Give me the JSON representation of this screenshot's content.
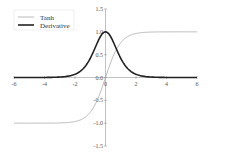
{
  "chart_data": {
    "type": "line",
    "title": "",
    "xlabel": "",
    "ylabel": "",
    "xlim": [
      -6,
      6
    ],
    "ylim": [
      -1.5,
      1.5
    ],
    "x_ticks": [
      -6,
      -4,
      -2,
      0,
      2,
      4,
      6
    ],
    "x_tick_labels": [
      "-6",
      "-4",
      "-2",
      "0",
      "2",
      "4",
      "6"
    ],
    "y_ticks": [
      1.5,
      1.0,
      0.5,
      0.0,
      -0.5,
      -1.0,
      -1.5
    ],
    "y_tick_labels": [
      "1.5",
      "1.0",
      "0.5",
      "0.0",
      "-0.5",
      "-1.0",
      "-1.5"
    ],
    "grid": false,
    "legend_position": "upper left",
    "series": [
      {
        "name": "Tanh",
        "color": "#aaaaaa",
        "width": 0.8,
        "function": "tanh(x)",
        "x": [
          -6,
          -4,
          -3,
          -2,
          -1.5,
          -1,
          -0.5,
          0,
          0.5,
          1,
          1.5,
          2,
          3,
          4,
          6
        ],
        "values": [
          -1.0,
          -0.999,
          -0.995,
          -0.964,
          -0.905,
          -0.762,
          -0.462,
          0.0,
          0.462,
          0.762,
          0.905,
          0.964,
          0.995,
          0.999,
          1.0
        ]
      },
      {
        "name": "Derivative",
        "color": "#222222",
        "width": 1.6,
        "function": "1 - tanh(x)^2",
        "x": [
          -6,
          -4,
          -3,
          -2,
          -1.5,
          -1,
          -0.5,
          0,
          0.5,
          1,
          1.5,
          2,
          3,
          4,
          6
        ],
        "values": [
          0.0,
          0.001,
          0.01,
          0.071,
          0.181,
          0.42,
          0.786,
          1.0,
          0.786,
          0.42,
          0.181,
          0.071,
          0.01,
          0.001,
          0.0
        ]
      }
    ]
  },
  "legend": {
    "items": [
      {
        "label": "Tanh"
      },
      {
        "label": "Derivative"
      }
    ]
  }
}
